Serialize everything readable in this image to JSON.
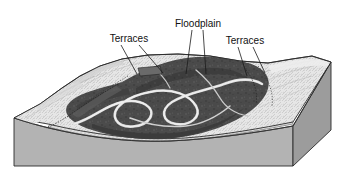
{
  "figure": {
    "background_color": "#ffffff"
  },
  "labels": [
    {
      "id": "terraces-left",
      "text": "Terraces",
      "x": 129,
      "y": 39,
      "anchor": "middle"
    },
    {
      "id": "floodplain",
      "text": "Floodplain",
      "x": 198,
      "y": 24,
      "anchor": "middle"
    },
    {
      "id": "terraces-right",
      "text": "Terraces",
      "x": 245,
      "y": 41,
      "anchor": "middle"
    }
  ],
  "leader_lines": [
    {
      "id": "leader-terraces-left-a",
      "x1": 121,
      "y1": 45,
      "x2": 137,
      "y2": 74
    },
    {
      "id": "leader-terraces-left-b",
      "x1": 139,
      "y1": 45,
      "x2": 163,
      "y2": 73
    },
    {
      "id": "leader-floodplain-a",
      "x1": 192,
      "y1": 30,
      "x2": 186,
      "y2": 74
    },
    {
      "id": "leader-floodplain-b",
      "x1": 203,
      "y1": 30,
      "x2": 206,
      "y2": 74
    },
    {
      "id": "leader-terraces-right-a",
      "x1": 238,
      "y1": 47,
      "x2": 247,
      "y2": 76
    },
    {
      "id": "leader-terraces-right-b",
      "x1": 253,
      "y1": 47,
      "x2": 265,
      "y2": 73
    }
  ],
  "colors": {
    "floodplain_dark": "#4a4a4a",
    "floodplain_darker": "#3d3d3d",
    "terrace_light": "#e8e8e8",
    "terrace_mid": "#cfcfcf",
    "river_channel": "#d8d8d8",
    "block_front_face": "#b3b3b3",
    "block_side_face": "#9c9c9c",
    "alluvium_band": "#dedede",
    "outline": "#2b2b2b",
    "label_text": "#111111"
  },
  "features": {
    "floodplain_name": "Floodplain",
    "terraces_name": "Terraces",
    "river_name": "Meandering river channel",
    "alluvium_name": "Alluvium",
    "bedrock_name": "Bedrock block"
  }
}
